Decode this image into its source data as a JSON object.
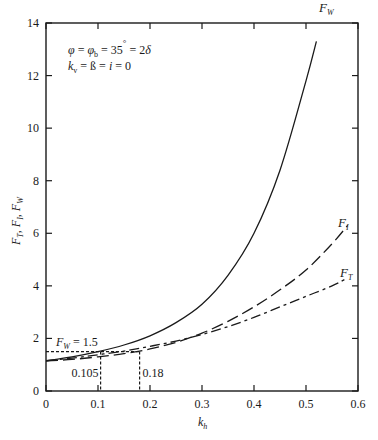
{
  "chart_data": {
    "type": "line",
    "title": "",
    "xlabel": "k_h",
    "ylabel": "F_T, F_I, F_W",
    "xlim": [
      0,
      0.6
    ],
    "ylim": [
      0,
      14
    ],
    "grid": false,
    "x_ticks": [
      "0",
      "0.1",
      "0.2",
      "0.3",
      "0.4",
      "0.5",
      "0.6"
    ],
    "y_ticks": [
      "0",
      "2",
      "4",
      "6",
      "8",
      "10",
      "12",
      "14"
    ],
    "parameters_text": [
      "φ = φb = 35° = 2δ",
      "kv = ß = i = 0"
    ],
    "series": [
      {
        "name": "F_W",
        "style": "solid",
        "x": [
          0,
          0.05,
          0.1,
          0.15,
          0.2,
          0.25,
          0.3,
          0.35,
          0.4,
          0.45,
          0.5,
          0.52
        ],
        "y": [
          1.15,
          1.3,
          1.5,
          1.75,
          2.1,
          2.6,
          3.3,
          4.4,
          6.0,
          8.4,
          11.8,
          13.3
        ]
      },
      {
        "name": "F_I",
        "style": "dashed",
        "x": [
          0,
          0.05,
          0.1,
          0.15,
          0.2,
          0.25,
          0.3,
          0.35,
          0.4,
          0.45,
          0.5,
          0.55,
          0.58
        ],
        "y": [
          1.15,
          1.2,
          1.3,
          1.42,
          1.6,
          1.85,
          2.2,
          2.65,
          3.2,
          3.85,
          4.6,
          5.6,
          6.3
        ]
      },
      {
        "name": "F_T",
        "style": "dash-dot",
        "x": [
          0,
          0.05,
          0.1,
          0.15,
          0.2,
          0.25,
          0.3,
          0.35,
          0.4,
          0.45,
          0.5,
          0.55,
          0.58
        ],
        "y": [
          1.15,
          1.25,
          1.38,
          1.52,
          1.7,
          1.9,
          2.15,
          2.45,
          2.8,
          3.2,
          3.6,
          4.0,
          4.3
        ]
      }
    ],
    "annotations": [
      {
        "text": "F_W = 1.5",
        "type": "horizontal-dashed-line",
        "y": 1.5
      },
      {
        "text": "0.105",
        "type": "vertical-dashed-line",
        "x": 0.105
      },
      {
        "text": "0.18",
        "type": "vertical-dashed-line",
        "x": 0.18
      }
    ],
    "legend": "inline labels at curve ends"
  },
  "labels": {
    "param_line1": "φ = φb = 35° = 2δ",
    "param_line2": "kv = ß = i = 0",
    "fw_eq": "FW = 1.5",
    "x_105": "0.105",
    "x_18": "0.18",
    "fw_end": "FW",
    "fi_end": "FI",
    "ft_end": "FT"
  }
}
